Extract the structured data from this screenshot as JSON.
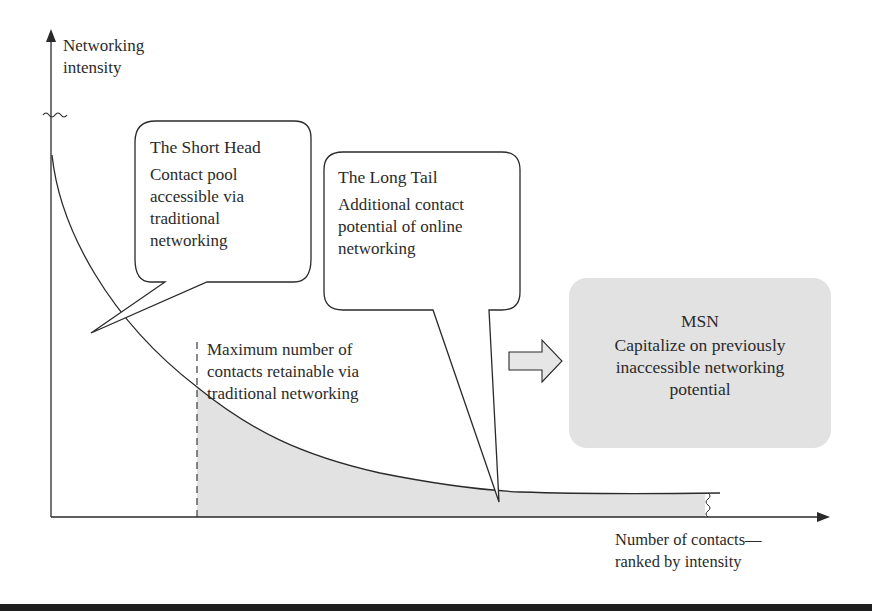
{
  "axes": {
    "y_label_lines": [
      "Networking",
      "intensity"
    ],
    "x_label_lines": [
      "Number of contacts—",
      "ranked by intensity"
    ]
  },
  "short_head": {
    "title": "The Short Head",
    "body_lines": [
      "Contact pool",
      "accessible via",
      "traditional",
      "networking"
    ]
  },
  "long_tail": {
    "title": "The Long Tail",
    "body_lines": [
      "Additional contact",
      "potential of online",
      "networking"
    ]
  },
  "threshold_note": {
    "lines": [
      "Maximum number of",
      "contacts retainable via",
      "traditional networking"
    ]
  },
  "msn": {
    "title": "MSN",
    "body_lines": [
      "Capitalize on previously",
      "inaccessible networking",
      "potential"
    ]
  },
  "colors": {
    "line": "#2a2a2a",
    "shaded_area": "#e2e2e2",
    "msn_box": "#e2e2e2",
    "arrow_fill": "#e6e6e6"
  }
}
